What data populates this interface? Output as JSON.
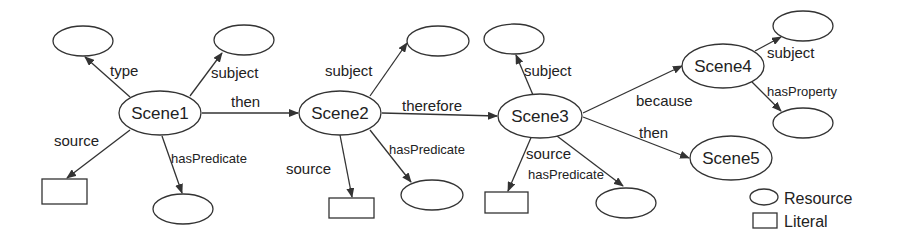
{
  "colors": {
    "stroke": "#333333",
    "text": "#222222",
    "background": "#ffffff"
  },
  "nodes": {
    "scene1": {
      "label": "Scene1"
    },
    "scene2": {
      "label": "Scene2"
    },
    "scene3": {
      "label": "Scene3"
    },
    "scene4": {
      "label": "Scene4"
    },
    "scene5": {
      "label": "Scene5"
    }
  },
  "edges": {
    "s1_type": "type",
    "s1_subject": "subject",
    "s1_then": "then",
    "s1_source": "source",
    "s1_hasPredicate": "hasPredicate",
    "s2_subject": "subject",
    "s2_therefore": "therefore",
    "s2_source": "source",
    "s2_hasPredicate": "hasPredicate",
    "s3_subject": "subject",
    "s3_source": "source",
    "s3_hasPredicate": "hasPredicate",
    "s3_because": "because",
    "s3_then": "then",
    "s4_subject": "subject",
    "s4_hasProperty": "hasProperty"
  },
  "legend": {
    "resource": "Resource",
    "literal": "Literal"
  }
}
